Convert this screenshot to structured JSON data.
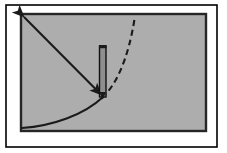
{
  "figure": {
    "title": "Mechanics diagram: pendulum rod with force vector and trajectory curves",
    "canvas": {
      "width": 227,
      "height": 153,
      "background": "#ffffff"
    },
    "outer_frame": {
      "name": "outer-border",
      "x": 6,
      "y": 5,
      "width": 211,
      "height": 142,
      "stroke": "#000000",
      "stroke_width": 1.6,
      "fill": "none"
    },
    "panel": {
      "name": "gray-panel",
      "x": 21,
      "y": 14,
      "width": 185,
      "height": 117,
      "fill": "#adadad",
      "stroke": "#262626",
      "stroke_width": 2.4
    },
    "straight_arrow": {
      "name": "straight-arrow",
      "from": {
        "x": 22,
        "y": 15
      },
      "to": {
        "x": 103,
        "y": 97
      },
      "stroke": "#1a1a1a",
      "stroke_width": 2.1,
      "arrowhead_start": true,
      "arrowhead_end": true
    },
    "rod": {
      "name": "vertical-rod",
      "x": 99.5,
      "y_top": 46,
      "y_bottom": 97,
      "width": 6.5,
      "fill": "#8e8e8e",
      "stroke": "#111111",
      "stroke_width": 1.4,
      "cap_fill": "#1a1a1a"
    },
    "dashed_curve": {
      "name": "dashed-trajectory-curve",
      "path": "M 102 98 C 115 86, 128 62, 135 16",
      "stroke": "#1a1a1a",
      "stroke_width": 2.1,
      "dash_pattern": "6 4",
      "fill": "none"
    },
    "solid_curve": {
      "name": "solid-trajectory-curve",
      "path": "M 22 128 C 52 126, 84 115, 103 97",
      "stroke": "#1a1a1a",
      "stroke_width": 2.0,
      "fill": "none"
    },
    "colors": {
      "ink": "#1a1a1a",
      "panel_gray": "#adadad",
      "panel_border": "#262626",
      "rod_gray": "#8e8e8e",
      "page_white": "#ffffff"
    }
  }
}
